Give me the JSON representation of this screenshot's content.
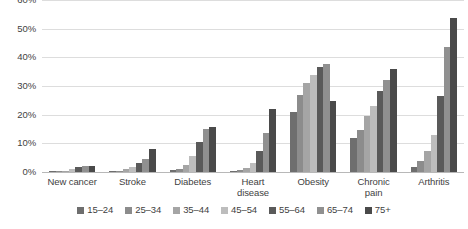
{
  "chart_data": {
    "type": "bar",
    "title": "",
    "subtitle": "",
    "xlabel": "",
    "ylabel": "",
    "ylim": [
      0,
      60
    ],
    "ytick_labels": [
      "0%",
      "10%",
      "20%",
      "30%",
      "40%",
      "50%",
      "60%"
    ],
    "ytick_values": [
      0,
      10,
      20,
      30,
      40,
      50,
      60
    ],
    "grid": true,
    "legend_position": "bottom",
    "categories": [
      "New cancer",
      "Stroke",
      "Diabetes",
      "Heart disease",
      "Obesity",
      "Chronic pain",
      "Arthritis"
    ],
    "category_lines": [
      [
        "New cancer"
      ],
      [
        "Stroke"
      ],
      [
        "Diabetes"
      ],
      [
        "Heart",
        "disease"
      ],
      [
        "Obesity"
      ],
      [
        "Chronic",
        "pain"
      ],
      [
        "Arthritis"
      ]
    ],
    "series": [
      {
        "name": "15–24",
        "color": "#6e6e6e",
        "values": [
          0.2,
          0.3,
          0.7,
          0.3,
          20.8,
          11.9,
          1.8
        ]
      },
      {
        "name": "25–34",
        "color": "#8c8c8c",
        "values": [
          0.3,
          0.5,
          1.2,
          0.6,
          27.0,
          14.8,
          4.0
        ]
      },
      {
        "name": "35–44",
        "color": "#a5a5a5",
        "values": [
          0.5,
          0.9,
          2.3,
          1.3,
          31.0,
          19.5,
          7.5
        ]
      },
      {
        "name": "45–54",
        "color": "#bdbdbd",
        "values": [
          0.9,
          1.6,
          5.5,
          3.2,
          34.0,
          23.0,
          13.0
        ]
      },
      {
        "name": "55–64",
        "color": "#5a5a5a",
        "values": [
          1.6,
          3.0,
          10.5,
          7.5,
          36.8,
          28.2,
          26.5
        ]
      },
      {
        "name": "65–74",
        "color": "#909090",
        "values": [
          2.0,
          4.5,
          15.0,
          13.5,
          37.6,
          32.0,
          43.5
        ]
      },
      {
        "name": "75+",
        "color": "#4a4a4a",
        "values": [
          2.2,
          8.2,
          15.8,
          22.0,
          24.8,
          35.8,
          53.8
        ]
      }
    ]
  }
}
